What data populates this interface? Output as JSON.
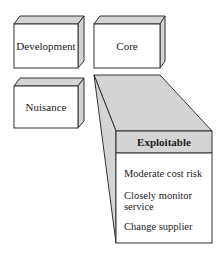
{
  "diagram": {
    "boxes": [
      {
        "id": "development",
        "label": "Development"
      },
      {
        "id": "core",
        "label": "Core"
      },
      {
        "id": "nuisance",
        "label": "Nuisance"
      }
    ],
    "expanded": {
      "title": "Exploitable",
      "items": [
        "Moderate cost risk",
        "Closely monitor service",
        "Change supplier"
      ],
      "expanded_from": "core"
    },
    "colors": {
      "face": "#ffffff",
      "shade": "#d4d4d4",
      "line": "#333333"
    }
  }
}
